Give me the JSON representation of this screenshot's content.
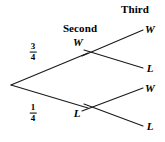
{
  "diagram": {
    "type": "probability-tree",
    "title": "",
    "stage_headers": [
      {
        "id": "second",
        "label": "Second",
        "x": 80,
        "y": 28
      },
      {
        "id": "third",
        "label": "Third",
        "x": 135,
        "y": 9
      }
    ],
    "root": {
      "id": "root",
      "x": 11,
      "y": 85
    },
    "nodes": [
      {
        "id": "second-w",
        "label": "W",
        "x": 88,
        "y": 53,
        "label_x": 78,
        "label_y": 42
      },
      {
        "id": "second-l",
        "label": "L",
        "x": 88,
        "y": 108,
        "label_x": 77,
        "label_y": 113
      },
      {
        "id": "third-ww",
        "label": "W",
        "x": 143,
        "y": 30,
        "label_x": 150,
        "label_y": 29
      },
      {
        "id": "third-wl",
        "label": "L",
        "x": 143,
        "y": 68,
        "label_x": 150,
        "label_y": 68
      },
      {
        "id": "third-lw",
        "label": "W",
        "x": 143,
        "y": 88,
        "label_x": 150,
        "label_y": 88
      },
      {
        "id": "third-ll",
        "label": "L",
        "x": 143,
        "y": 126,
        "label_x": 150,
        "label_y": 126
      }
    ],
    "branch_labels": [
      {
        "id": "p-second-w",
        "numerator": "3",
        "denominator": "4",
        "x": 33,
        "y": 52
      },
      {
        "id": "p-second-l",
        "numerator": "1",
        "denominator": "4",
        "x": 33,
        "y": 113
      }
    ],
    "edges": [
      {
        "id": "edge-root-w",
        "from": "root",
        "to": "second-w",
        "x1": 11,
        "y1": 85,
        "x2": 88,
        "y2": 53
      },
      {
        "id": "edge-root-l",
        "from": "root",
        "to": "second-l",
        "x1": 11,
        "y1": 85,
        "x2": 88,
        "y2": 108
      },
      {
        "id": "edge-w-ww",
        "from": "second-w",
        "to": "third-ww",
        "x1": 88,
        "y1": 53,
        "x2": 143,
        "y2": 30
      },
      {
        "id": "edge-w-wl",
        "from": "second-w",
        "to": "third-wl",
        "x1": 88,
        "y1": 53,
        "x2": 143,
        "y2": 68
      },
      {
        "id": "edge-l-lw",
        "from": "second-l",
        "to": "third-lw",
        "x1": 88,
        "y1": 108,
        "x2": 143,
        "y2": 88
      },
      {
        "id": "edge-l-ll",
        "from": "second-l",
        "to": "third-ll",
        "x1": 88,
        "y1": 108,
        "x2": 143,
        "y2": 126
      }
    ],
    "colors": {
      "line": "#1a1a1a",
      "text": "#000000",
      "background": "#ffffff"
    }
  }
}
